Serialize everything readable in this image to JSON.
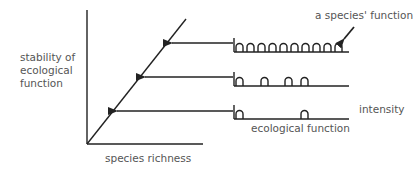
{
  "diagram": {
    "y_axis_label": [
      "stability of",
      "ecological",
      "function"
    ],
    "x_axis_label": "species richness",
    "annotation_species_function": "a species' function",
    "annotation_intensity": "intensity",
    "annotation_ecological_function": "ecological function",
    "line_color": "#222222",
    "text_color": "#555555",
    "panels": [
      {
        "name": "high-richness",
        "bump_count": 10
      },
      {
        "name": "medium-richness",
        "bump_count": 4
      },
      {
        "name": "low-richness",
        "bump_count": 2
      }
    ]
  }
}
